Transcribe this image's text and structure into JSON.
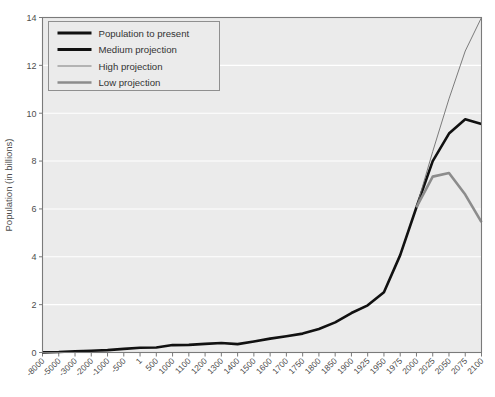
{
  "chart_data": {
    "type": "line",
    "title": "",
    "xlabel": "",
    "ylabel": "Population (in billions)",
    "ylim": [
      0,
      14
    ],
    "yticks": [
      0,
      2,
      4,
      6,
      8,
      10,
      12,
      14
    ],
    "grid": true,
    "legend_position": "top-left",
    "x_categories": [
      "-8000",
      "-5000",
      "-3000",
      "-2000",
      "-1000",
      "-500",
      "1",
      "500",
      "1000",
      "1100",
      "1200",
      "1300",
      "1400",
      "1500",
      "1600",
      "1700",
      "1750",
      "1800",
      "1850",
      "1900",
      "1925",
      "1950",
      "1975",
      "2000",
      "2025",
      "2050",
      "2075",
      "2100"
    ],
    "series": [
      {
        "name": "Population to present",
        "color": "#111111",
        "width": 2.6,
        "x": [
          "-8000",
          "-5000",
          "-3000",
          "-2000",
          "-1000",
          "-500",
          "1",
          "500",
          "1000",
          "1100",
          "1200",
          "1300",
          "1400",
          "1500",
          "1600",
          "1700",
          "1750",
          "1800",
          "1850",
          "1900",
          "1925",
          "1950",
          "1975",
          "2000"
        ],
        "values": [
          0.005,
          0.02,
          0.05,
          0.07,
          0.1,
          0.15,
          0.2,
          0.21,
          0.31,
          0.32,
          0.36,
          0.4,
          0.35,
          0.46,
          0.58,
          0.68,
          0.79,
          0.98,
          1.26,
          1.65,
          1.97,
          2.52,
          4.07,
          6.07
        ]
      },
      {
        "name": "Medium projection",
        "color": "#111111",
        "width": 2.6,
        "x": [
          "2000",
          "2025",
          "2050",
          "2075",
          "2100"
        ],
        "values": [
          6.07,
          8.0,
          9.15,
          9.75,
          9.55
        ]
      },
      {
        "name": "High projection",
        "color": "#6e6e6e",
        "width": 0.9,
        "x": [
          "2000",
          "2025",
          "2050",
          "2075",
          "2100"
        ],
        "values": [
          6.07,
          8.4,
          10.6,
          12.6,
          14.0
        ]
      },
      {
        "name": "Low projection",
        "color": "#8c8c8c",
        "width": 2.6,
        "x": [
          "2000",
          "2025",
          "2050",
          "2075",
          "2100"
        ],
        "values": [
          6.07,
          7.35,
          7.5,
          6.6,
          5.45
        ]
      }
    ]
  },
  "legend": {
    "entries": [
      {
        "label": "Population to present",
        "color": "#111111",
        "width": 3.2
      },
      {
        "label": "Medium projection",
        "color": "#111111",
        "width": 3.2
      },
      {
        "label": "High projection",
        "color": "#a0a0a0",
        "width": 1.4
      },
      {
        "label": "Low projection",
        "color": "#8c8c8c",
        "width": 2.6
      }
    ]
  },
  "style": {
    "plot_background": "#ebebeb",
    "gridline_color": "#ffffff",
    "axis_color": "#7a7a7a",
    "text_color": "#4d4d4d",
    "page_background": "#ffffff"
  }
}
